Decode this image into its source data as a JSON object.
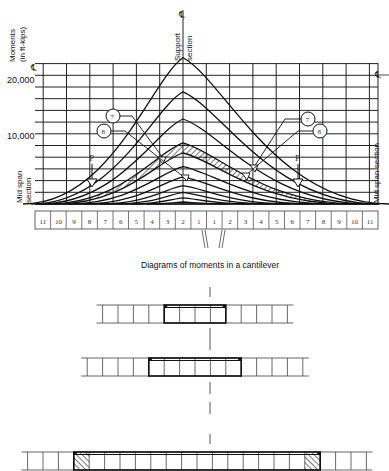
{
  "chart_data": {
    "type": "line",
    "ylabel": "Moments (in ft-kips)",
    "yticks": [
      {
        "value": 20000,
        "label": "20,000"
      },
      {
        "value": 10000,
        "label": "10,000"
      }
    ],
    "ylim": [
      0,
      25000
    ],
    "grid": true,
    "center_label": "Support section",
    "centerline_symbol": "℄",
    "side_labels": {
      "left": "Mid span section",
      "right": "Mid span section"
    },
    "load_label": "P",
    "callouts": [
      "7",
      "8"
    ],
    "curves": [
      {
        "name": "stage 11",
        "peak": 21500
      },
      {
        "name": "stage 10",
        "peak": 16500
      },
      {
        "name": "stage 9",
        "peak": 12500
      },
      {
        "name": "stage 8 (hatched band upper)",
        "peak": 9000
      },
      {
        "name": "stage 7 (hatched band lower)",
        "peak": 7500
      },
      {
        "name": "stage 6",
        "peak": 5500
      },
      {
        "name": "stage 5",
        "peak": 4000
      },
      {
        "name": "stage 4",
        "peak": 2700
      },
      {
        "name": "stage 3",
        "peak": 1700
      },
      {
        "name": "stage 2",
        "peak": 900
      },
      {
        "name": "stage 1",
        "peak": 300
      }
    ],
    "segment_labels": [
      "11",
      "10",
      "9",
      "8",
      "7",
      "6",
      "5",
      "4",
      "3",
      "2",
      "1",
      "1",
      "2",
      "3",
      "4",
      "5",
      "6",
      "7",
      "8",
      "9",
      "10",
      "11"
    ]
  },
  "labels": {
    "y_axis_line1": "Moments",
    "y_axis_line2": "(in ft-kips)",
    "tick_20000": "20,000",
    "tick_10000": "10,000",
    "support_line1": "Support",
    "support_line2": "section",
    "centerline": "℄",
    "mid_span_left_1": "Mid span",
    "mid_span_left_2": "section",
    "mid_span_right": "Mid span section",
    "load_left": "P",
    "load_right": "P",
    "callout_7": "7",
    "callout_8": "8",
    "subtitle": "Diagrams of moments in a cantilever"
  },
  "cantilever_diagrams": [
    {
      "name": "stage-short",
      "segments_total": 12,
      "tendon_cells": 4
    },
    {
      "name": "stage-medium",
      "segments_total": 14,
      "tendon_cells": 6
    },
    {
      "name": "stage-full",
      "segments_total": 22,
      "tendon_cells": 16
    }
  ]
}
